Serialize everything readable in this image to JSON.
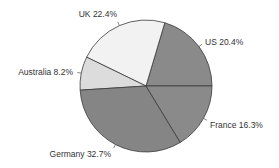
{
  "chart_data": {
    "type": "pie",
    "title": "",
    "start_angle_deg": 0,
    "direction": "counterclockwise",
    "center": [
      146,
      86
    ],
    "radius": 66,
    "slices": [
      {
        "label": "US",
        "value": 20.4,
        "display": "US 20.4%",
        "color": "#8a8a8a"
      },
      {
        "label": "UK",
        "value": 22.4,
        "display": "UK 22.4%",
        "color": "#f2f2f2"
      },
      {
        "label": "Australia",
        "value": 8.2,
        "display": "Australia 8.2%",
        "color": "#dcdcdc"
      },
      {
        "label": "Germany",
        "value": 32.7,
        "display": "Germany 32.7%",
        "color": "#858585"
      },
      {
        "label": "France",
        "value": 16.3,
        "display": "France 16.3%",
        "color": "#8a8a8a"
      }
    ],
    "categories": [
      "US",
      "UK",
      "Australia",
      "Germany",
      "France"
    ],
    "values": [
      20.4,
      22.4,
      8.2,
      32.7,
      16.3
    ],
    "legend": "none (direct labels)",
    "label_positions": {
      "US": [
        205,
        45,
        "start"
      ],
      "UK": [
        117,
        17,
        "end"
      ],
      "Australia": [
        73,
        75,
        "end"
      ],
      "Germany": [
        111,
        157,
        "end"
      ],
      "France": [
        210,
        128,
        "start"
      ]
    }
  }
}
